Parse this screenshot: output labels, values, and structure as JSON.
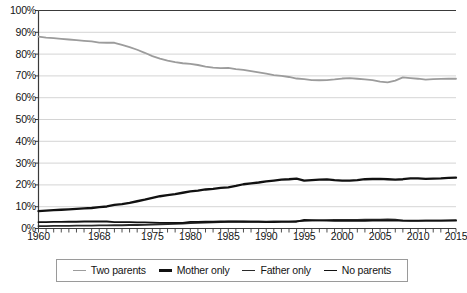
{
  "chart_data": {
    "type": "line",
    "title": "",
    "subtitle": "",
    "xlabel": "",
    "ylabel": "",
    "xlim": [
      1960,
      2015
    ],
    "ylim": [
      0,
      100
    ],
    "grid": "horizontal",
    "legend_position": "bottom",
    "y_ticks": [
      "0%",
      "10%",
      "20%",
      "30%",
      "40%",
      "50%",
      "60%",
      "70%",
      "80%",
      "90%",
      "100%"
    ],
    "y_tick_values": [
      0,
      10,
      20,
      30,
      40,
      50,
      60,
      70,
      80,
      90,
      100
    ],
    "x_ticks": [
      "1960",
      "1968",
      "1975",
      "1980",
      "1985",
      "1990",
      "1995",
      "2000",
      "2005",
      "2010",
      "2015"
    ],
    "x_tick_values": [
      1960,
      1968,
      1975,
      1980,
      1985,
      1990,
      1995,
      2000,
      2005,
      2010,
      2015
    ],
    "x": [
      1960,
      1961,
      1962,
      1963,
      1964,
      1965,
      1966,
      1967,
      1968,
      1969,
      1970,
      1971,
      1972,
      1973,
      1974,
      1975,
      1976,
      1977,
      1978,
      1979,
      1980,
      1981,
      1982,
      1983,
      1984,
      1985,
      1986,
      1987,
      1988,
      1989,
      1990,
      1991,
      1992,
      1993,
      1994,
      1995,
      1996,
      1997,
      1998,
      1999,
      2000,
      2001,
      2002,
      2003,
      2004,
      2005,
      2006,
      2007,
      2008,
      2009,
      2010,
      2011,
      2012,
      2013,
      2014,
      2015
    ],
    "series": [
      {
        "name": "Two parents",
        "color": "#9c9c9c",
        "width": 1.8,
        "values": [
          88.0,
          87.6,
          87.3,
          87.0,
          86.7,
          86.4,
          86.1,
          85.8,
          85.3,
          85.2,
          85.2,
          84.2,
          83.2,
          82.0,
          80.6,
          79.1,
          77.9,
          77.0,
          76.3,
          75.8,
          75.5,
          75.0,
          74.3,
          73.8,
          73.6,
          73.7,
          73.1,
          72.8,
          72.2,
          71.6,
          71.0,
          70.4,
          70.0,
          69.5,
          68.8,
          68.5,
          68.1,
          68.0,
          68.1,
          68.4,
          68.8,
          69.0,
          68.7,
          68.4,
          68.1,
          67.4,
          67.0,
          67.8,
          69.3,
          69.0,
          68.7,
          68.3,
          68.5,
          68.6,
          68.7,
          68.7
        ]
      },
      {
        "name": "Mother only",
        "color": "#111111",
        "width": 2.3,
        "values": [
          8.0,
          8.2,
          8.4,
          8.6,
          8.8,
          9.0,
          9.2,
          9.4,
          9.8,
          10.1,
          10.8,
          11.2,
          11.8,
          12.5,
          13.2,
          14.0,
          14.8,
          15.3,
          15.8,
          16.4,
          17.0,
          17.4,
          17.9,
          18.2,
          18.6,
          18.9,
          19.5,
          20.3,
          20.7,
          21.1,
          21.6,
          22.0,
          22.4,
          22.6,
          22.9,
          22.0,
          22.2,
          22.4,
          22.5,
          22.2,
          22.0,
          22.0,
          22.2,
          22.6,
          22.7,
          22.8,
          22.6,
          22.4,
          22.6,
          23.0,
          23.0,
          22.8,
          22.9,
          23.0,
          23.2,
          23.3
        ]
      },
      {
        "name": "Father only",
        "color": "#2a2a2a",
        "width": 1.8,
        "values": [
          1.1,
          1.1,
          1.2,
          1.2,
          1.2,
          1.3,
          1.3,
          1.3,
          1.4,
          1.4,
          1.5,
          1.5,
          1.6,
          1.6,
          1.7,
          1.8,
          1.9,
          2.0,
          2.1,
          2.2,
          2.5,
          2.6,
          2.7,
          2.8,
          2.9,
          3.1,
          3.1,
          3.2,
          3.2,
          3.2,
          3.1,
          3.2,
          3.3,
          3.3,
          3.4,
          3.5,
          3.6,
          3.7,
          3.8,
          3.9,
          4.0,
          4.0,
          4.0,
          4.1,
          4.1,
          4.1,
          4.2,
          4.1,
          3.6,
          3.5,
          3.5,
          3.6,
          3.6,
          3.6,
          3.7,
          3.8
        ]
      },
      {
        "name": "No parents",
        "color": "#111111",
        "width": 1.8,
        "values": [
          2.9,
          2.9,
          3.0,
          3.0,
          3.1,
          3.1,
          3.2,
          3.2,
          3.3,
          3.2,
          2.9,
          2.9,
          2.9,
          2.8,
          2.8,
          2.7,
          2.6,
          2.6,
          2.6,
          2.6,
          3.0,
          3.0,
          3.1,
          3.1,
          3.2,
          3.2,
          3.2,
          3.1,
          3.0,
          3.0,
          2.9,
          2.9,
          3.0,
          3.0,
          3.1,
          3.9,
          3.8,
          3.7,
          3.6,
          3.5,
          3.5,
          3.5,
          3.5,
          3.5,
          3.6,
          3.6,
          3.6,
          3.6,
          3.6,
          3.6,
          3.6,
          3.6,
          3.6,
          3.6,
          3.6,
          3.6
        ]
      }
    ]
  },
  "legend": {
    "items": [
      {
        "label": "Two parents"
      },
      {
        "label": "Mother only"
      },
      {
        "label": "Father only"
      },
      {
        "label": "No parents"
      }
    ]
  }
}
